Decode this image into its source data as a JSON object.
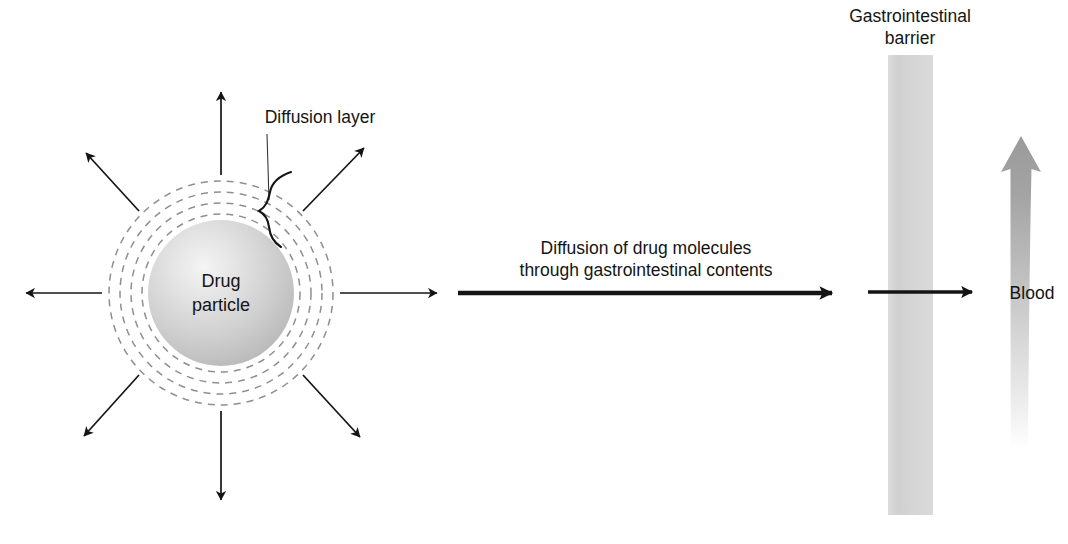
{
  "figure": {
    "background_color": "#ffffff",
    "ink_color": "#141414",
    "dashed_ring_color": "#8c8c8c",
    "barrier_color": "#d3d3d3",
    "blood_color": "#9e9e9e",
    "particle_fill_light": "#f2f2f2",
    "particle_fill_dark": "#b9b9b9"
  },
  "labels": {
    "diffusion_layer": "Diffusion layer",
    "drug_particle_line1": "Drug",
    "drug_particle_line2": "particle",
    "diffusion_flow_line1": "Diffusion of drug molecules",
    "diffusion_flow_line2": "through gastrointestinal contents",
    "gi_barrier_line1": "Gastrointestinal",
    "gi_barrier_line2": "barrier",
    "blood": "Blood"
  },
  "particle": {
    "center_x": 221,
    "center_y": 293,
    "core_radius": 73,
    "diffusion_rings": [
      79,
      90,
      101,
      112
    ],
    "ring_dash": "7 6"
  },
  "radial_arrows": [
    {
      "name": "arrow-up",
      "angle_deg": 270,
      "tail_r": 116,
      "tip_r": 205
    },
    {
      "name": "arrow-up-right",
      "angle_deg": 315,
      "tail_r": 116,
      "tip_r": 198
    },
    {
      "name": "arrow-right",
      "angle_deg": 0,
      "tail_r": 116,
      "tip_r": 219
    },
    {
      "name": "arrow-down-right",
      "angle_deg": 45,
      "tail_r": 116,
      "tip_r": 198
    },
    {
      "name": "arrow-down",
      "angle_deg": 90,
      "tail_r": 116,
      "tip_r": 212
    },
    {
      "name": "arrow-down-left",
      "angle_deg": 135,
      "tail_r": 116,
      "tip_r": 198
    },
    {
      "name": "arrow-left",
      "angle_deg": 180,
      "tail_r": 116,
      "tip_r": 199
    },
    {
      "name": "arrow-up-left",
      "angle_deg": 225,
      "tail_r": 116,
      "tip_r": 198
    }
  ],
  "main_arrow": {
    "x1": 458,
    "x2": 838,
    "y": 293,
    "stroke_width": 4.5
  },
  "barrier": {
    "x": 888,
    "y": 55,
    "width": 45,
    "height": 460
  },
  "barrier_arrow": {
    "x1": 868,
    "x2": 978,
    "y": 292,
    "stroke_width": 3.2
  },
  "blood_vessel": {
    "tip_x": 1021,
    "tip_y": 136,
    "bottom_y": 448,
    "body_width": 19,
    "head_width": 40
  },
  "text_positions": {
    "diffusion_layer_x": 320,
    "diffusion_layer_y": 123,
    "drug_particle_x": 221,
    "drug_particle_y1": 287,
    "drug_particle_y2": 311,
    "flow_x": 646,
    "flow_y1": 254,
    "flow_y2": 275,
    "gi_barrier_x": 910,
    "gi_barrier_y1": 22,
    "gi_barrier_y2": 44,
    "blood_x": 1032,
    "blood_y": 299
  }
}
